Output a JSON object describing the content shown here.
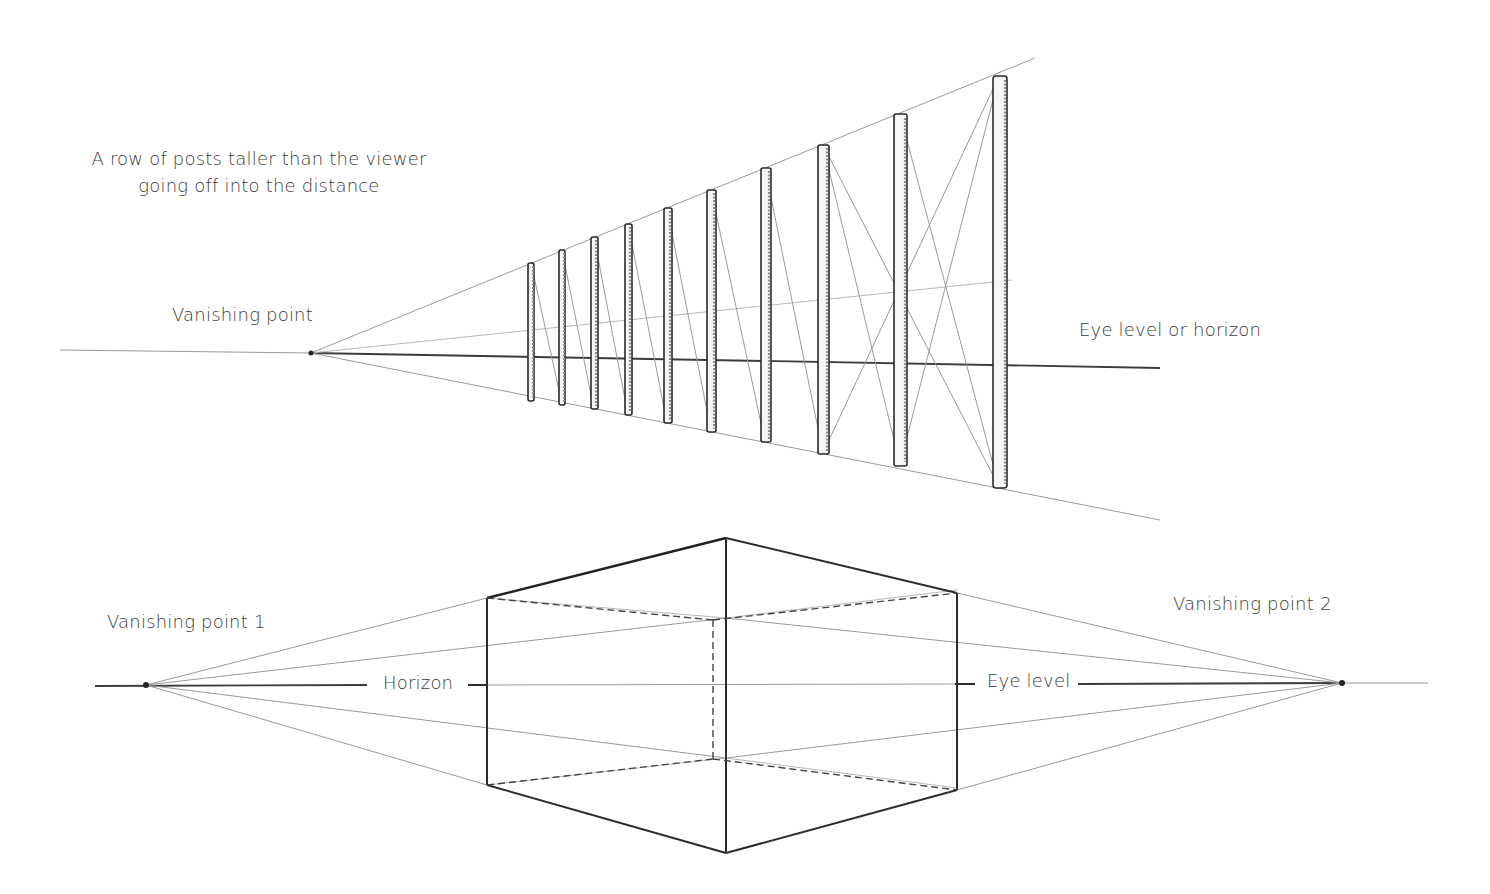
{
  "figure_top": {
    "caption": [
      "A row of posts taller than the viewer",
      "going off into the distance"
    ],
    "vanishing_point_label": "Vanishing point",
    "horizon_label": "Eye level or horizon",
    "vanishing_point": {
      "x": 311,
      "y": 353
    },
    "post_count": 10
  },
  "figure_bottom": {
    "vanishing_point_1_label": "Vanishing point 1",
    "vanishing_point_2_label": "Vanishing point 2",
    "horizon_label": "Horizon",
    "eye_level_label": "Eye level",
    "vanishing_point_1": {
      "x": 146,
      "y": 685
    },
    "vanishing_point_2": {
      "x": 1342,
      "y": 683
    },
    "shape": "cube in two-point perspective with hidden edges dashed"
  },
  "colors": {
    "ink": "#2a2a2a",
    "guide": "#9a9a9a",
    "text": "#3a3a3a",
    "background": "#ffffff"
  }
}
